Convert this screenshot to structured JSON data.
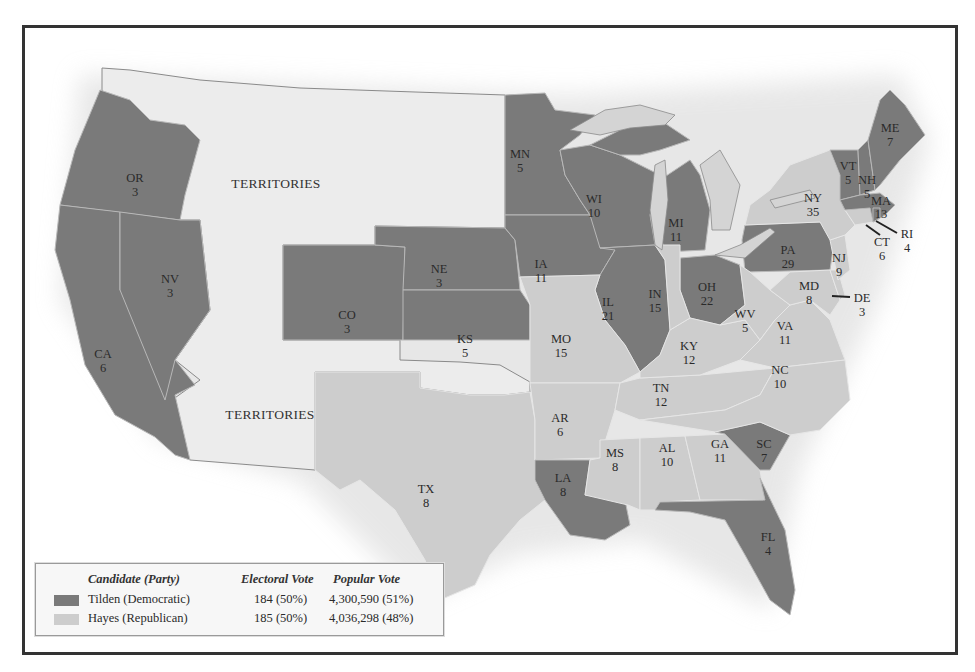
{
  "map": {
    "type": "choropleth",
    "subject": "Presidential election electoral results by state",
    "colors": {
      "tilden": "#7a7a7a",
      "hayes": "#cdcdcd",
      "territories": "#ececec"
    },
    "territory_labels": [
      "TERRITORIES",
      "TERRITORIES"
    ],
    "states": [
      {
        "abbr": "OR",
        "ev": "3",
        "party": "tilden"
      },
      {
        "abbr": "CA",
        "ev": "6",
        "party": "tilden"
      },
      {
        "abbr": "NV",
        "ev": "3",
        "party": "tilden"
      },
      {
        "abbr": "CO",
        "ev": "3",
        "party": "tilden"
      },
      {
        "abbr": "NE",
        "ev": "3",
        "party": "tilden"
      },
      {
        "abbr": "KS",
        "ev": "5",
        "party": "tilden"
      },
      {
        "abbr": "MN",
        "ev": "5",
        "party": "tilden"
      },
      {
        "abbr": "IA",
        "ev": "11",
        "party": "tilden"
      },
      {
        "abbr": "WI",
        "ev": "10",
        "party": "tilden"
      },
      {
        "abbr": "IL",
        "ev": "21",
        "party": "tilden"
      },
      {
        "abbr": "MI",
        "ev": "11",
        "party": "tilden"
      },
      {
        "abbr": "OH",
        "ev": "22",
        "party": "tilden"
      },
      {
        "abbr": "PA",
        "ev": "29",
        "party": "tilden"
      },
      {
        "abbr": "LA",
        "ev": "8",
        "party": "tilden"
      },
      {
        "abbr": "SC",
        "ev": "7",
        "party": "tilden"
      },
      {
        "abbr": "FL",
        "ev": "4",
        "party": "tilden"
      },
      {
        "abbr": "ME",
        "ev": "7",
        "party": "tilden"
      },
      {
        "abbr": "VT",
        "ev": "5",
        "party": "tilden"
      },
      {
        "abbr": "NH",
        "ev": "5",
        "party": "tilden"
      },
      {
        "abbr": "MA",
        "ev": "13",
        "party": "tilden"
      },
      {
        "abbr": "RI",
        "ev": "4",
        "party": "tilden"
      },
      {
        "abbr": "TX",
        "ev": "8",
        "party": "hayes"
      },
      {
        "abbr": "MO",
        "ev": "15",
        "party": "hayes"
      },
      {
        "abbr": "AR",
        "ev": "6",
        "party": "hayes"
      },
      {
        "abbr": "MS",
        "ev": "8",
        "party": "hayes"
      },
      {
        "abbr": "AL",
        "ev": "10",
        "party": "hayes"
      },
      {
        "abbr": "GA",
        "ev": "11",
        "party": "hayes"
      },
      {
        "abbr": "TN",
        "ev": "12",
        "party": "hayes"
      },
      {
        "abbr": "KY",
        "ev": "12",
        "party": "hayes"
      },
      {
        "abbr": "IN",
        "ev": "15",
        "party": "hayes"
      },
      {
        "abbr": "WV",
        "ev": "5",
        "party": "hayes"
      },
      {
        "abbr": "VA",
        "ev": "11",
        "party": "hayes"
      },
      {
        "abbr": "NC",
        "ev": "10",
        "party": "hayes"
      },
      {
        "abbr": "MD",
        "ev": "8",
        "party": "hayes"
      },
      {
        "abbr": "DE",
        "ev": "3",
        "party": "hayes"
      },
      {
        "abbr": "NJ",
        "ev": "9",
        "party": "hayes"
      },
      {
        "abbr": "NY",
        "ev": "35",
        "party": "hayes"
      },
      {
        "abbr": "CT",
        "ev": "6",
        "party": "hayes"
      }
    ]
  },
  "legend": {
    "headers": {
      "candidate": "Candidate (Party)",
      "electoral": "Electoral Vote",
      "popular": "Popular Vote"
    },
    "rows": [
      {
        "candidate": "Tilden (Democratic)",
        "electoral": "184 (50%)",
        "popular": "4,300,590 (51%)",
        "color": "#7a7a7a"
      },
      {
        "candidate": "Hayes (Republican)",
        "electoral": "185 (50%)",
        "popular": "4,036,298 (48%)",
        "color": "#cdcdcd"
      }
    ]
  }
}
